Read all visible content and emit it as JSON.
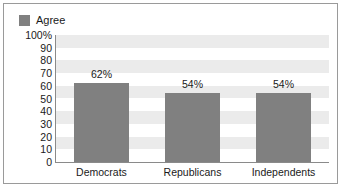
{
  "chart_data": {
    "type": "bar",
    "title": "",
    "xlabel": "",
    "ylabel": "",
    "categories": [
      "Democrats",
      "Republicans",
      "Independents"
    ],
    "values": [
      62,
      54,
      54
    ],
    "data_labels": [
      "62%",
      "54%",
      "54%"
    ],
    "series": [
      {
        "name": "Agree",
        "values": [
          62,
          54,
          54
        ]
      }
    ],
    "ylim": [
      0,
      100
    ],
    "ytick_labels": [
      "100%",
      "90",
      "80",
      "70",
      "60",
      "50",
      "40",
      "30",
      "20",
      "10",
      "0"
    ],
    "ytick_values": [
      100,
      90,
      80,
      70,
      60,
      50,
      40,
      30,
      20,
      10,
      0
    ],
    "grid": "alternating-horizontal-bands",
    "legend": {
      "position": "top-left",
      "entries": [
        "Agree"
      ]
    },
    "colors": {
      "bar": "#808080",
      "legend_swatch": "#808080",
      "band": "#ebebeb",
      "background": "#ffffff",
      "axis": "#8a8a8a",
      "border": "#9a9a9a",
      "text": "#1a1a1a"
    }
  },
  "legend": {
    "label": "Agree"
  }
}
